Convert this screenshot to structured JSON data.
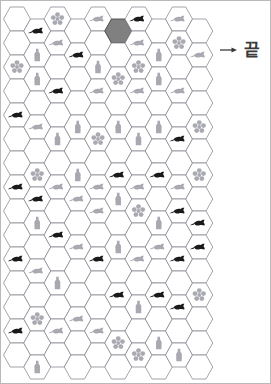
{
  "page": {
    "background_color": "#ffffff",
    "border_color": "#b9b9b9"
  },
  "labels": {
    "end_text": "끝",
    "end_icon": "arrow-right-icon"
  },
  "colors": {
    "hex_stroke": "#7d7d87",
    "hex_fill": "#ffffff",
    "start_hex_fill": "#808080",
    "start_hex_stroke": "#4a4a4a",
    "icon_dark": "#1a1a1a",
    "icon_light": "#9b9ba5",
    "arrow_color": "#3b3b3b",
    "text_color": "#3b3b3b"
  },
  "grid": {
    "orientation": "flat-top",
    "hex_width": 27,
    "hex_height": 24,
    "columns": 10,
    "rows": 15,
    "origin_x": 16,
    "origin_y": 18
  },
  "icons": {
    "fish": "fish-icon",
    "flower": "flower-icon",
    "bottle": "bottle-icon",
    "empty": "empty-cell"
  },
  "cells": [
    {
      "col": 1,
      "row": 0,
      "icon": "fish",
      "shade": "dark"
    },
    {
      "col": 2,
      "row": 0,
      "icon": "flower",
      "shade": "light"
    },
    {
      "col": 4,
      "row": 0,
      "icon": "fish",
      "shade": "light"
    },
    {
      "col": 6,
      "row": 0,
      "icon": "fish",
      "shade": "dark"
    },
    {
      "col": 8,
      "row": 0,
      "icon": "fish",
      "shade": "light"
    },
    {
      "col": 5,
      "row": 0,
      "icon": "empty",
      "shade": "start"
    },
    {
      "col": 7,
      "row": 1,
      "icon": "bottle",
      "shade": "light"
    },
    {
      "col": 9,
      "row": 1,
      "icon": "fish",
      "shade": "light"
    },
    {
      "col": 6,
      "row": 1,
      "icon": "fish",
      "shade": "light"
    },
    {
      "col": 1,
      "row": 1,
      "icon": "bottle",
      "shade": "light"
    },
    {
      "col": 2,
      "row": 1,
      "icon": "fish",
      "shade": "light"
    },
    {
      "col": 3,
      "row": 1,
      "icon": "fish",
      "shade": "dark"
    },
    {
      "col": 6,
      "row": 2,
      "icon": "flower",
      "shade": "light"
    },
    {
      "col": 8,
      "row": 1,
      "icon": "flower",
      "shade": "light"
    },
    {
      "col": 0,
      "row": 2,
      "icon": "flower",
      "shade": "light"
    },
    {
      "col": 1,
      "row": 2,
      "icon": "bottle",
      "shade": "light"
    },
    {
      "col": 4,
      "row": 2,
      "icon": "bottle",
      "shade": "light"
    },
    {
      "col": 5,
      "row": 2,
      "icon": "flower",
      "shade": "light"
    },
    {
      "col": 7,
      "row": 2,
      "icon": "bottle",
      "shade": "light"
    },
    {
      "col": 2,
      "row": 3,
      "icon": "fish",
      "shade": "dark"
    },
    {
      "col": 4,
      "row": 3,
      "icon": "fish",
      "shade": "light"
    },
    {
      "col": 6,
      "row": 3,
      "icon": "fish",
      "shade": "light"
    },
    {
      "col": 8,
      "row": 3,
      "icon": "fish",
      "shade": "light"
    },
    {
      "col": 0,
      "row": 4,
      "icon": "fish",
      "shade": "dark"
    },
    {
      "col": 1,
      "row": 4,
      "icon": "fish",
      "shade": "light"
    },
    {
      "col": 3,
      "row": 4,
      "icon": "bottle",
      "shade": "light"
    },
    {
      "col": 5,
      "row": 4,
      "icon": "bottle",
      "shade": "light"
    },
    {
      "col": 7,
      "row": 4,
      "icon": "bottle",
      "shade": "light"
    },
    {
      "col": 9,
      "row": 4,
      "icon": "flower",
      "shade": "light"
    },
    {
      "col": 2,
      "row": 5,
      "icon": "bottle",
      "shade": "light"
    },
    {
      "col": 4,
      "row": 5,
      "icon": "flower",
      "shade": "light"
    },
    {
      "col": 6,
      "row": 5,
      "icon": "bottle",
      "shade": "light"
    },
    {
      "col": 8,
      "row": 5,
      "icon": "fish",
      "shade": "dark"
    },
    {
      "col": 1,
      "row": 6,
      "icon": "flower",
      "shade": "light"
    },
    {
      "col": 3,
      "row": 6,
      "icon": "bottle",
      "shade": "light"
    },
    {
      "col": 5,
      "row": 6,
      "icon": "fish",
      "shade": "dark"
    },
    {
      "col": 7,
      "row": 6,
      "icon": "fish",
      "shade": "dark"
    },
    {
      "col": 9,
      "row": 6,
      "icon": "flower",
      "shade": "light"
    },
    {
      "col": 0,
      "row": 7,
      "icon": "fish",
      "shade": "dark"
    },
    {
      "col": 2,
      "row": 7,
      "icon": "fish",
      "shade": "light"
    },
    {
      "col": 4,
      "row": 7,
      "icon": "fish",
      "shade": "light"
    },
    {
      "col": 6,
      "row": 7,
      "icon": "fish",
      "shade": "light"
    },
    {
      "col": 8,
      "row": 7,
      "icon": "fish",
      "shade": "light"
    },
    {
      "col": 1,
      "row": 7,
      "icon": "fish",
      "shade": "dark"
    },
    {
      "col": 3,
      "row": 7,
      "icon": "fish",
      "shade": "light"
    },
    {
      "col": 5,
      "row": 7,
      "icon": "bottle",
      "shade": "light"
    },
    {
      "col": 7,
      "row": 8,
      "icon": "bottle",
      "shade": "light"
    },
    {
      "col": 9,
      "row": 8,
      "icon": "fish",
      "shade": "dark"
    },
    {
      "col": 1,
      "row": 8,
      "icon": "bottle",
      "shade": "light"
    },
    {
      "col": 4,
      "row": 8,
      "icon": "fish",
      "shade": "light"
    },
    {
      "col": 6,
      "row": 8,
      "icon": "flower",
      "shade": "light"
    },
    {
      "col": 8,
      "row": 8,
      "icon": "fish",
      "shade": "dark"
    },
    {
      "col": 2,
      "row": 9,
      "icon": "fish",
      "shade": "dark"
    },
    {
      "col": 3,
      "row": 9,
      "icon": "fish",
      "shade": "light"
    },
    {
      "col": 5,
      "row": 9,
      "icon": "bottle",
      "shade": "light"
    },
    {
      "col": 7,
      "row": 9,
      "icon": "fish",
      "shade": "light"
    },
    {
      "col": 9,
      "row": 9,
      "icon": "fish",
      "shade": "dark"
    },
    {
      "col": 0,
      "row": 10,
      "icon": "fish",
      "shade": "dark"
    },
    {
      "col": 1,
      "row": 10,
      "icon": "fish",
      "shade": "light"
    },
    {
      "col": 4,
      "row": 10,
      "icon": "fish",
      "shade": "dark"
    },
    {
      "col": 6,
      "row": 10,
      "icon": "fish",
      "shade": "light"
    },
    {
      "col": 8,
      "row": 10,
      "icon": "fish",
      "shade": "dark"
    },
    {
      "col": 2,
      "row": 11,
      "icon": "bottle",
      "shade": "light"
    },
    {
      "col": 5,
      "row": 11,
      "icon": "fish",
      "shade": "dark"
    },
    {
      "col": 7,
      "row": 11,
      "icon": "fish",
      "shade": "dark"
    },
    {
      "col": 9,
      "row": 11,
      "icon": "flower",
      "shade": "light"
    },
    {
      "col": 1,
      "row": 12,
      "icon": "flower",
      "shade": "light"
    },
    {
      "col": 3,
      "row": 12,
      "icon": "fish",
      "shade": "light"
    },
    {
      "col": 6,
      "row": 12,
      "icon": "bottle",
      "shade": "light"
    },
    {
      "col": 8,
      "row": 12,
      "icon": "fish",
      "shade": "dark"
    },
    {
      "col": 0,
      "row": 13,
      "icon": "fish",
      "shade": "dark"
    },
    {
      "col": 2,
      "row": 13,
      "icon": "fish",
      "shade": "light"
    },
    {
      "col": 4,
      "row": 13,
      "icon": "fish",
      "shade": "light"
    },
    {
      "col": 5,
      "row": 13,
      "icon": "flower",
      "shade": "light"
    },
    {
      "col": 7,
      "row": 13,
      "icon": "bottle",
      "shade": "light"
    },
    {
      "col": 1,
      "row": 14,
      "icon": "bottle",
      "shade": "light"
    },
    {
      "col": 6,
      "row": 14,
      "icon": "flower",
      "shade": "light"
    },
    {
      "col": 8,
      "row": 14,
      "icon": "bottle",
      "shade": "light"
    }
  ]
}
